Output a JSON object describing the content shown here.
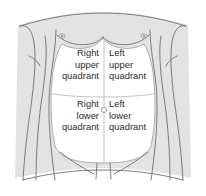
{
  "figure": {
    "colors": {
      "body_fill": "#e3e3e3",
      "body_outline": "#6f6f6f",
      "abdomen_fill": "#ffffff",
      "divider_line": "#b9b9b9",
      "abdomen_outline": "#9a9a9a",
      "text": "#2b2b2b",
      "background": "#ffffff"
    }
  },
  "quadrants": [
    {
      "id": "right-upper-quadrant",
      "abbr": "RUQ",
      "side": "right",
      "level": "upper",
      "line1": "Right",
      "line2": "upper",
      "line3": "quadrant"
    },
    {
      "id": "left-upper-quadrant",
      "abbr": "LUQ",
      "side": "left",
      "level": "upper",
      "line1": "Left",
      "line2": "upper",
      "line3": "quadrant"
    },
    {
      "id": "right-lower-quadrant",
      "abbr": "RLQ",
      "side": "right",
      "level": "lower",
      "line1": "Right",
      "line2": "lower",
      "line3": "quadrant"
    },
    {
      "id": "left-lower-quadrant",
      "abbr": "LLQ",
      "side": "left",
      "level": "lower",
      "line1": "Left",
      "line2": "lower",
      "line3": "quadrant"
    }
  ],
  "anatomy_markers": [
    {
      "id": "nipple-right",
      "name": "nipple-right-icon"
    },
    {
      "id": "nipple-left",
      "name": "nipple-left-icon"
    },
    {
      "id": "umbilicus",
      "name": "umbilicus-icon"
    }
  ]
}
